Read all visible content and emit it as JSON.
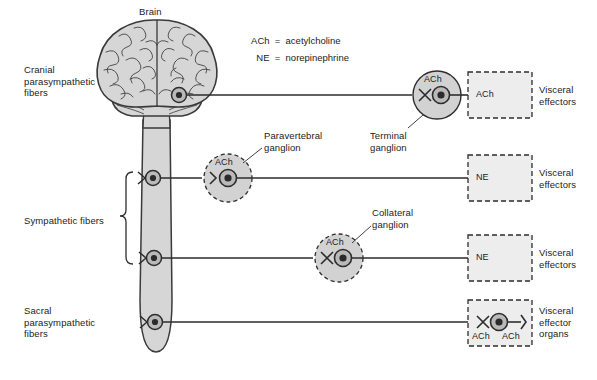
{
  "diagram": {
    "colors": {
      "tissue_fill": "#d6d6d6",
      "tissue_stroke": "#3a3a3a",
      "ganglion_fill": "#d2d2d2",
      "effector_fill": "#ededed",
      "line": "#2d2d2d",
      "text": "#1c1c1c"
    },
    "legend": [
      {
        "term": "ACh",
        "equals": "=",
        "definition": "acetylcholine"
      },
      {
        "term": "NE",
        "equals": "=",
        "definition": "norepinephrine"
      }
    ],
    "structures": {
      "brain_label": "Brain"
    },
    "left_labels": [
      {
        "name": "cranial-parasympathetic",
        "text": "Cranial\nparasympathetic\nfibers"
      },
      {
        "name": "sympathetic",
        "text": "Sympathetic fibers"
      },
      {
        "name": "sacral-parasympathetic",
        "text": "Sacral\nparasympathetic\nfibers"
      }
    ],
    "ganglia": [
      {
        "name": "terminal-ganglion",
        "label": "Terminal\nganglion",
        "transmitter": "ACh",
        "style": "solid"
      },
      {
        "name": "paravertebral-ganglion",
        "label": "Paravertebral\nganglion",
        "transmitter": "ACh",
        "style": "dashed"
      },
      {
        "name": "collateral-ganglion",
        "label": "Collateral\nganglion",
        "transmitter": "ACh",
        "style": "dashed"
      }
    ],
    "effectors": [
      {
        "name": "effector-cranial",
        "transmitter": "ACh",
        "label": "Visceral\neffectors"
      },
      {
        "name": "effector-sympathetic-upper",
        "transmitter": "NE",
        "label": "Visceral\neffectors"
      },
      {
        "name": "effector-sympathetic-lower",
        "transmitter": "NE",
        "label": "Visceral\neffectors"
      },
      {
        "name": "effector-sacral",
        "transmitter_pre": "ACh",
        "transmitter_post": "ACh",
        "label": "Visceral\neffector\norgans"
      }
    ]
  }
}
